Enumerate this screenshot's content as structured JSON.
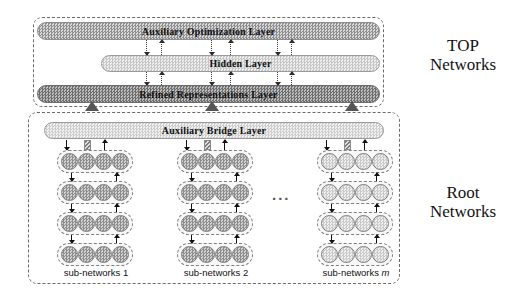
{
  "figure": {
    "side_labels": {
      "top": "TOP\nNetworks",
      "root": "Root\nNetworks"
    },
    "ellipsis": "..."
  },
  "top_networks": {
    "layers": [
      {
        "id": "auxiliary-optimization-layer",
        "label": "Auxiliary Optimization Layer",
        "shade": "#8f8f8f"
      },
      {
        "id": "hidden-layer",
        "label": "Hidden  Layer",
        "shade": "#c6c6c6"
      },
      {
        "id": "refined-representations-layer",
        "label": "Refined Representations Layer",
        "shade": "#6e6e6e"
      }
    ]
  },
  "bridge": {
    "id": "auxiliary-bridge-layer",
    "label": "Auxiliary Bridge Layer",
    "shade": "#cdcdcd"
  },
  "root_networks": {
    "subnetworks": [
      {
        "id": "sub-networks-1",
        "label": "sub-networks 1",
        "label_italic": "",
        "tone": "dark",
        "rows": 4,
        "nodes_per_row": 4
      },
      {
        "id": "sub-networks-2",
        "label": "sub-networks 2",
        "label_italic": "",
        "tone": "dark",
        "rows": 4,
        "nodes_per_row": 4
      },
      {
        "id": "sub-networks-m",
        "label": "sub-networks ",
        "label_italic": "m",
        "tone": "light",
        "rows": 4,
        "nodes_per_row": 4
      }
    ]
  },
  "colors": {
    "dash_border": "#6a6a6a",
    "node_border": "#7d7d7d",
    "arrow": "#111111",
    "triangle": "#555555",
    "background": "#ffffff"
  }
}
